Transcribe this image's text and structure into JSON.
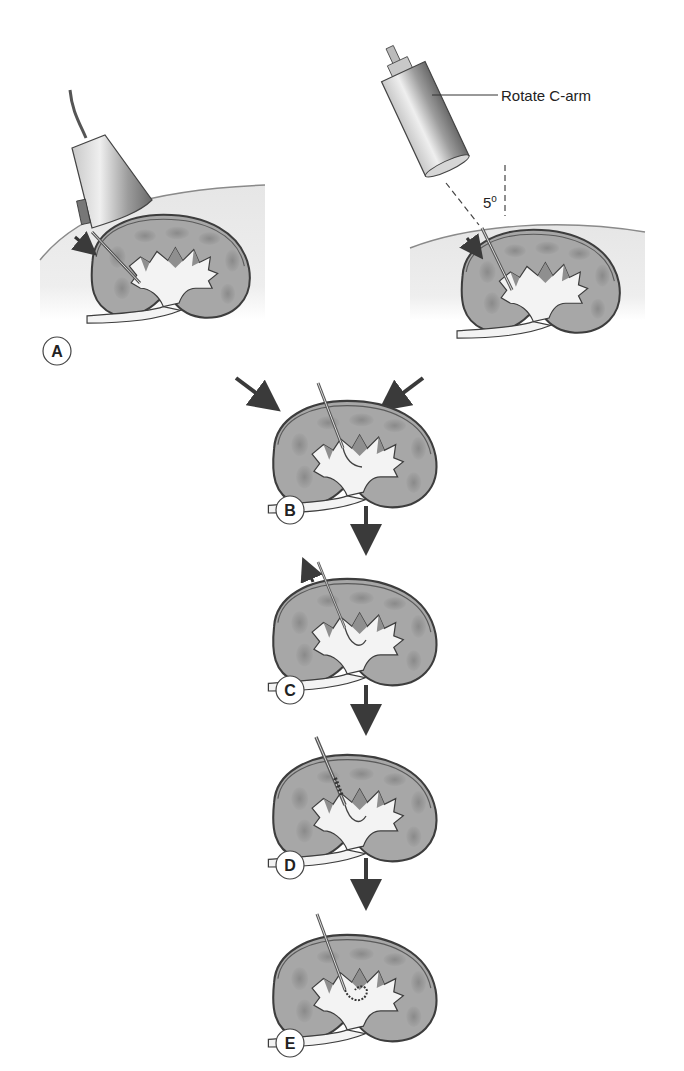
{
  "diagram": {
    "type": "procedure-flow",
    "panels": [
      {
        "id": "A",
        "label": "A",
        "content": "Ultrasound probe guiding needle through skin into kidney collecting system"
      },
      {
        "id": "A2",
        "label": "",
        "content": "C-arm fluoroscopy guiding needle into kidney",
        "callout": "Rotate C-arm",
        "angle_label": "5",
        "angle_unit": "o"
      },
      {
        "id": "B",
        "label": "B",
        "content": "Needle in calyx, guidewire advanced"
      },
      {
        "id": "C",
        "label": "C",
        "content": "Needle withdrawn over guidewire"
      },
      {
        "id": "D",
        "label": "D",
        "content": "Dilator/sheath advanced over guidewire"
      },
      {
        "id": "E",
        "label": "E",
        "content": "Coiled guidewire in collecting system"
      }
    ],
    "flow": [
      "A -> B",
      "A2 -> B",
      "B -> C",
      "C -> D",
      "D -> E"
    ],
    "colors": {
      "skin_fill": "#ececec",
      "kidney_fill": "#a9a9a9",
      "kidney_outline": "#444444",
      "cortex_spot": "#8d8d8d",
      "collecting_system": "#f2f2f2",
      "arrow": "#3a3a3a",
      "device": "#9a9a9a"
    }
  }
}
